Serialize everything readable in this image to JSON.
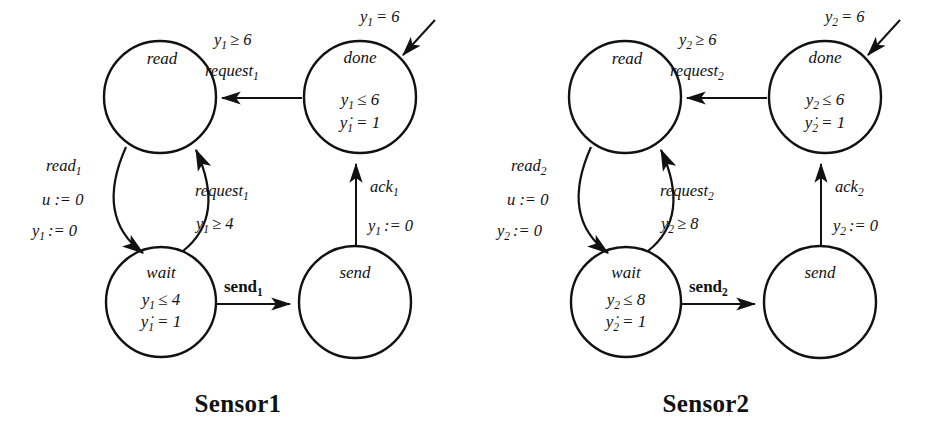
{
  "figure": {
    "background": "#ffffff",
    "ink": "#111111",
    "type": "hybrid-automata-pair"
  },
  "automata": [
    {
      "id": "sensor1",
      "caption": "Sensor1",
      "index": "1",
      "nodes": [
        {
          "id": "read",
          "name": "read",
          "invariant": []
        },
        {
          "id": "done",
          "name": "done",
          "invariant": [
            "y1 ≤ 6",
            "ỳ1 = 1"
          ]
        },
        {
          "id": "wait",
          "name": "wait",
          "invariant": [
            "y1 ≤ 4",
            "ỳ1 = 1"
          ]
        },
        {
          "id": "send",
          "name": "send",
          "invariant": []
        }
      ],
      "edges": [
        {
          "id": "done-to-read",
          "from": "done",
          "to": "read",
          "labels": [
            "y1 ≥ 6",
            "request1"
          ]
        },
        {
          "id": "read-to-wait",
          "from": "read",
          "to": "wait",
          "labels": [
            "read1",
            "u := 0",
            "y1 := 0"
          ]
        },
        {
          "id": "wait-to-read",
          "from": "wait",
          "to": "read",
          "labels": [
            "request1",
            "y1 ≥ 4"
          ]
        },
        {
          "id": "wait-to-send",
          "from": "wait",
          "to": "send",
          "labels": [
            "send1"
          ]
        },
        {
          "id": "send-to-done",
          "from": "send",
          "to": "done",
          "labels": [
            "ack1",
            "y1 := 0"
          ]
        },
        {
          "id": "incoming-done",
          "from": "",
          "to": "done",
          "labels": [
            "y1 = 6"
          ]
        }
      ],
      "label_text": {
        "done_inv_1_base": "y",
        "done_inv_1_sub": "1",
        "done_inv_1_rest": "≤ 6",
        "done_inv_2_base": "y",
        "done_inv_2_sub": "1",
        "done_inv_2_rest": "= 1",
        "wait_inv_1_base": "y",
        "wait_inv_1_sub": "1",
        "wait_inv_1_rest": "≤ 4",
        "wait_inv_2_base": "y",
        "wait_inv_2_sub": "1",
        "wait_inv_2_rest": "= 1",
        "top_guard_base": "y",
        "top_guard_sub": "1",
        "top_guard_rest": "≥ 6",
        "top_event_base": "request",
        "top_event_sub": "1",
        "left_event_base": "read",
        "left_event_sub": "1",
        "left_reset_u": "u := 0",
        "left_reset_y_base": "y",
        "left_reset_y_sub": "1",
        "left_reset_y_rest": ":= 0",
        "mid_event_base": "request",
        "mid_event_sub": "1",
        "mid_guard_base": "y",
        "mid_guard_sub": "1",
        "mid_guard_rest": "≥ 4",
        "bottom_event_base": "send",
        "bottom_event_sub": "1",
        "right_event_base": "ack",
        "right_event_sub": "1",
        "right_reset_base": "y",
        "right_reset_sub": "1",
        "right_reset_rest": ":= 0",
        "incoming_base": "y",
        "incoming_sub": "1",
        "incoming_rest": "= 6"
      }
    },
    {
      "id": "sensor2",
      "caption": "Sensor2",
      "index": "2",
      "nodes": [
        {
          "id": "read",
          "name": "read",
          "invariant": []
        },
        {
          "id": "done",
          "name": "done",
          "invariant": [
            "y2 ≤ 6",
            "ỳ2 = 1"
          ]
        },
        {
          "id": "wait",
          "name": "wait",
          "invariant": [
            "y2 ≤ 8",
            "ỳ2 = 1"
          ]
        },
        {
          "id": "send",
          "name": "send",
          "invariant": []
        }
      ],
      "edges": [
        {
          "id": "done-to-read",
          "from": "done",
          "to": "read",
          "labels": [
            "y2 ≥ 6",
            "request2"
          ]
        },
        {
          "id": "read-to-wait",
          "from": "read",
          "to": "wait",
          "labels": [
            "read2",
            "u := 0",
            "y2 := 0"
          ]
        },
        {
          "id": "wait-to-read",
          "from": "wait",
          "to": "read",
          "labels": [
            "request2",
            "y2 ≥ 8"
          ]
        },
        {
          "id": "wait-to-send",
          "from": "wait",
          "to": "send",
          "labels": [
            "send2"
          ]
        },
        {
          "id": "send-to-done",
          "from": "send",
          "to": "done",
          "labels": [
            "ack2",
            "y2 := 0"
          ]
        },
        {
          "id": "incoming-done",
          "from": "",
          "to": "done",
          "labels": [
            "y2 = 6"
          ]
        }
      ],
      "label_text": {
        "done_inv_1_base": "y",
        "done_inv_1_sub": "2",
        "done_inv_1_rest": "≤ 6",
        "done_inv_2_base": "y",
        "done_inv_2_sub": "2",
        "done_inv_2_rest": "= 1",
        "wait_inv_1_base": "y",
        "wait_inv_1_sub": "2",
        "wait_inv_1_rest": "≤ 8",
        "wait_inv_2_base": "y",
        "wait_inv_2_sub": "2",
        "wait_inv_2_rest": "= 1",
        "top_guard_base": "y",
        "top_guard_sub": "2",
        "top_guard_rest": "≥ 6",
        "top_event_base": "request",
        "top_event_sub": "2",
        "left_event_base": "read",
        "left_event_sub": "2",
        "left_reset_u": "u := 0",
        "left_reset_y_base": "y",
        "left_reset_y_sub": "2",
        "left_reset_y_rest": ":= 0",
        "mid_event_base": "request",
        "mid_event_sub": "2",
        "mid_guard_base": "y",
        "mid_guard_sub": "2",
        "mid_guard_rest": "≥ 8",
        "bottom_event_base": "send",
        "bottom_event_sub": "2",
        "right_event_base": "ack",
        "right_event_sub": "2",
        "right_reset_base": "y",
        "right_reset_sub": "2",
        "right_reset_rest": ":= 0",
        "incoming_base": "y",
        "incoming_sub": "2",
        "incoming_rest": "= 6"
      }
    }
  ],
  "node_names": {
    "read": "read",
    "done": "done",
    "wait": "wait",
    "send": "send"
  }
}
